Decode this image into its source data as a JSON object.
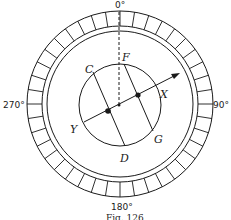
{
  "figure": {
    "caption": "Fig. 126",
    "degree_labels": {
      "top": "0°",
      "right": "90°",
      "bottom": "180°",
      "left": "270°"
    },
    "point_labels": {
      "C": "C",
      "F": "F",
      "X": "X",
      "Y": "Y",
      "G": "G",
      "D": "D"
    },
    "scale_divisions": 40,
    "colors": {
      "ink": "#1a1a1a",
      "background": "#ffffff"
    }
  }
}
